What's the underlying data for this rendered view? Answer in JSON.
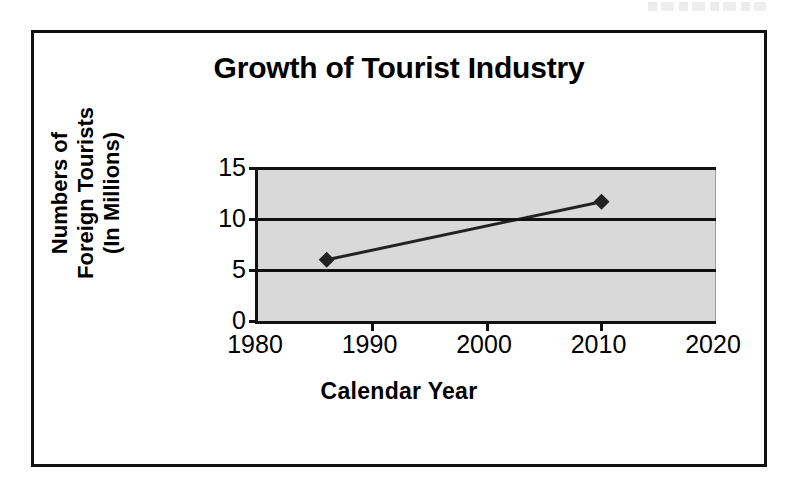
{
  "page": {
    "background_color": "#ffffff",
    "artifact_note": ""
  },
  "chart_frame": {
    "border_color": "#111111",
    "background_color": "#ffffff"
  },
  "chart_data": {
    "type": "line",
    "title": "Growth of Tourist Industry",
    "xlabel": "Calendar Year",
    "ylabel": "Numbers of\nForeign Tourists\n(In Millions)",
    "ylabel_lines": [
      "Numbers of",
      "Foreign Tourists",
      "(In Millions)"
    ],
    "x": [
      1986,
      2010
    ],
    "values": [
      6.0,
      11.7
    ],
    "points": [
      {
        "x": 1986,
        "y": 6.0
      },
      {
        "x": 2010,
        "y": 11.7
      }
    ],
    "xlim": [
      1980,
      2020
    ],
    "ylim": [
      0,
      15
    ],
    "xticks": [
      1980,
      1990,
      2000,
      2010,
      2020
    ],
    "yticks": [
      0,
      5,
      10,
      15
    ],
    "xtick_labels": [
      "1980",
      "1990",
      "2000",
      "2010",
      "2020"
    ],
    "ytick_labels": [
      "0",
      "5",
      "10",
      "15"
    ],
    "grid": true,
    "grid_axis": "y",
    "legend": false,
    "legend_position": "none",
    "marker": "diamond",
    "marker_color": "#222222",
    "line_color": "#222222",
    "plot_background": "#d9d9d9",
    "gridline_color": "#111111",
    "axis_color": "#111111"
  }
}
